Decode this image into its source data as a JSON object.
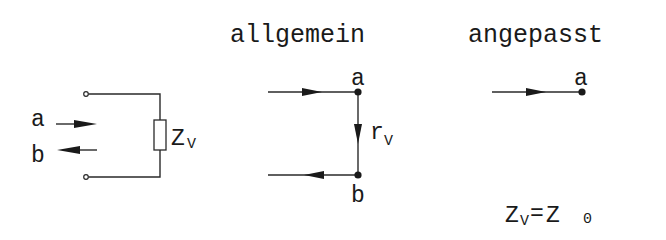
{
  "diagram": {
    "sections": {
      "circuit": {
        "wave_in_label": "a",
        "wave_out_label": "b",
        "impedance_label": "Z",
        "impedance_sub": "V"
      },
      "general": {
        "title": "allgemein",
        "node_top_label": "a",
        "node_bottom_label": "b",
        "reflection_label": "r",
        "reflection_sub": "V"
      },
      "matched": {
        "title": "angepasst",
        "node_label": "a",
        "condition": {
          "lhs": "Z",
          "lhs_sub": "V",
          "equals": "=",
          "rhs": "Z",
          "rhs_sub": "0"
        }
      }
    },
    "colors": {
      "ink": "#1a1a1a",
      "background": "#ffffff"
    }
  }
}
